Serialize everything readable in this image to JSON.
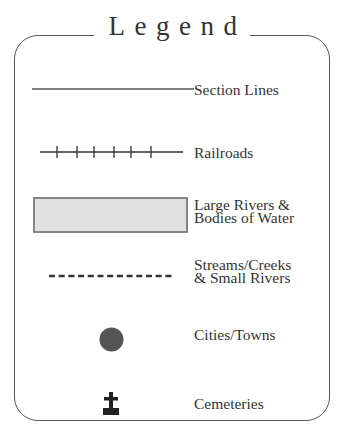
{
  "legend": {
    "title": "Legend",
    "items": [
      {
        "symbol": "section-line",
        "label": "Section Lines"
      },
      {
        "symbol": "railroad-line",
        "label": "Railroads"
      },
      {
        "symbol": "water-area",
        "label_line1": "Large Rivers &",
        "label_line2": "Bodies of Water"
      },
      {
        "symbol": "stream-dashed-line",
        "label_line1": "Streams/Creeks",
        "label_line2": "& Small Rivers"
      },
      {
        "symbol": "city-dot",
        "label": "Cities/Towns"
      },
      {
        "symbol": "cemetery-cross",
        "label": "Cemeteries"
      }
    ]
  },
  "colors": {
    "ink": "#333333",
    "border": "#555555",
    "water_fill": "#e2e2e2",
    "water_border": "#7a7a7a",
    "city_fill": "#555555"
  }
}
